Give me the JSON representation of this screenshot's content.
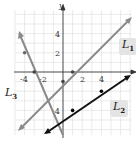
{
  "graph": {
    "axis_x_label": "",
    "axis_y_label": "y",
    "x_ticks": [
      "-4",
      "-2",
      "2",
      "4"
    ],
    "y_ticks": [
      "4",
      "2",
      "-4"
    ],
    "origin_px": [
      63,
      72
    ],
    "unit_px": 9.6,
    "lines": [
      {
        "name": "L1",
        "label_main": "L",
        "label_sub": "1",
        "equation": "y = x - 1",
        "color": "#8a8a8a",
        "points": [
          [
            0,
            -1
          ],
          [
            1,
            0
          ]
        ]
      },
      {
        "name": "L2",
        "label_main": "L",
        "label_sub": "2",
        "equation": "y = (2/3)x - 14/3",
        "color": "#111111",
        "points": [
          [
            1,
            -4
          ],
          [
            4,
            -2
          ]
        ]
      },
      {
        "name": "L3",
        "label_main": "L",
        "label_sub": "3",
        "equation": "y = -2x - 6",
        "color": "#8a8a8a",
        "points": [
          [
            -4,
            2
          ],
          [
            -3,
            0
          ]
        ]
      }
    ],
    "grid_color": "#dcdcdc"
  }
}
